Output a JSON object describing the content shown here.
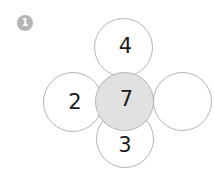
{
  "question": {
    "number": "1"
  },
  "flower": {
    "center": "7",
    "top": "4",
    "left": "2",
    "right": "",
    "bottom": "3"
  },
  "colors": {
    "background": "#ffffff",
    "circle_stroke": "#b5b5b5",
    "center_fill": "#e1e1e1",
    "badge_fill": "#b5b5b5",
    "badge_text": "#ffffff",
    "number_text": "#1b1b1b"
  }
}
